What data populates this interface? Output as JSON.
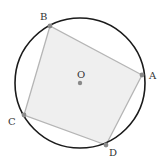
{
  "diagram": {
    "type": "inscribed-quadrilateral",
    "circle": {
      "cx": 80,
      "cy": 83,
      "r": 65,
      "stroke": "#1a1a1a"
    },
    "center": {
      "label": "O",
      "x": 80,
      "y": 83,
      "label_x": 77,
      "label_y": 78
    },
    "quadrilateral": {
      "fill": "#efefef",
      "stroke": "#b5b5b5",
      "vertices": [
        {
          "label": "A",
          "x": 142,
          "y": 75,
          "label_x": 149,
          "label_y": 79
        },
        {
          "label": "B",
          "x": 50,
          "y": 26,
          "label_x": 40,
          "label_y": 20
        },
        {
          "label": "C",
          "x": 24,
          "y": 115,
          "label_x": 8,
          "label_y": 125
        },
        {
          "label": "D",
          "x": 106,
          "y": 145,
          "label_x": 109,
          "label_y": 156
        }
      ]
    },
    "point_color": "#8a8a8a"
  }
}
